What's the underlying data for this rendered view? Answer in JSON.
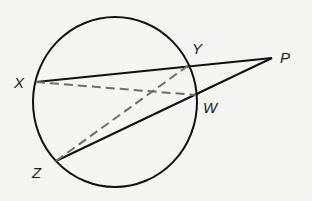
{
  "diagram": {
    "type": "geometry",
    "circle": {
      "cx": 115,
      "cy": 102,
      "rx": 82,
      "ry": 85,
      "stroke": "#111111"
    },
    "points": {
      "X": {
        "x": 36,
        "y": 82,
        "label": "X",
        "lx": 14,
        "ly": 88
      },
      "Y": {
        "x": 189,
        "y": 65,
        "label": "Y",
        "lx": 192,
        "ly": 54
      },
      "P": {
        "x": 272,
        "y": 58,
        "label": "P",
        "lx": 280,
        "ly": 63
      },
      "W": {
        "x": 196,
        "y": 95,
        "label": "W",
        "lx": 203,
        "ly": 113
      },
      "Z": {
        "x": 56,
        "y": 161,
        "label": "Z",
        "lx": 32,
        "ly": 178
      }
    },
    "solid_segments": [
      [
        "X",
        "P"
      ],
      [
        "Z",
        "P"
      ]
    ],
    "dashed_segments": [
      [
        "X",
        "W"
      ],
      [
        "Z",
        "Y"
      ]
    ],
    "colors": {
      "solid": "#111111",
      "dashed": "#6e6e6e"
    }
  }
}
